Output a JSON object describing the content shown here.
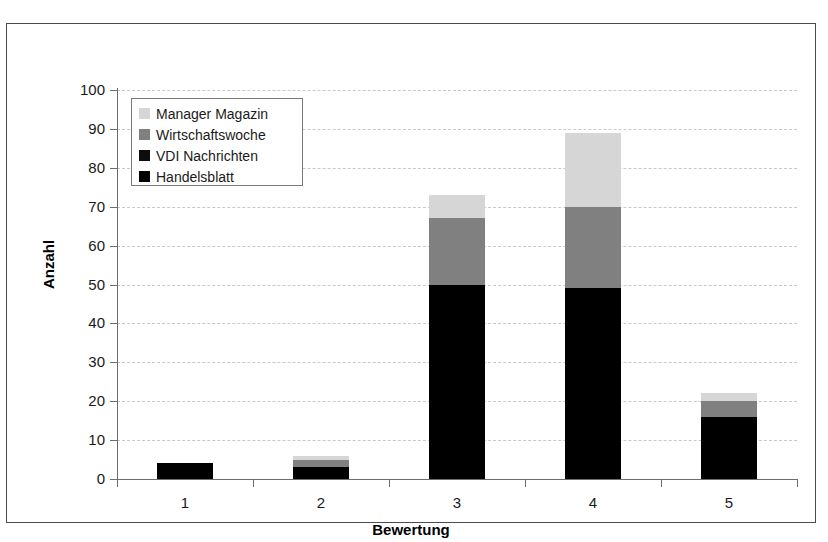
{
  "chart_data": {
    "type": "bar",
    "subtype": "stacked",
    "title": "",
    "xlabel": "Bewertung",
    "ylabel": "Anzahl",
    "categories": [
      "1",
      "2",
      "3",
      "4",
      "5"
    ],
    "ylim": [
      0,
      100
    ],
    "ytick_step": 10,
    "yticks": [
      "0",
      "10",
      "20",
      "30",
      "40",
      "50",
      "60",
      "70",
      "80",
      "90",
      "100"
    ],
    "grid": true,
    "grid_style": "dashed horizontal",
    "legend_position": "upper left inside plot",
    "series": [
      {
        "name": "Handelsblatt",
        "color": "#000000",
        "values": [
          4,
          3,
          50,
          49,
          16
        ]
      },
      {
        "name": "VDI Nachrichten",
        "color": "#0d0d0d",
        "values": [
          0,
          0,
          0,
          0,
          0
        ]
      },
      {
        "name": "Wirtschaftswoche",
        "color": "#808080",
        "values": [
          0,
          2,
          17,
          21,
          4
        ]
      },
      {
        "name": "Manager Magazin",
        "color": "#d6d6d6",
        "values": [
          0,
          1,
          6,
          19,
          2
        ]
      }
    ],
    "stack_order_bottom_to_top": [
      "Handelsblatt",
      "VDI Nachrichten",
      "Wirtschaftswoche",
      "Manager Magazin"
    ],
    "totals": [
      4,
      6,
      73,
      89,
      22
    ]
  },
  "legend": {
    "entries": [
      {
        "label": "Manager Magazin",
        "color": "#d6d6d6"
      },
      {
        "label": "Wirtschaftswoche",
        "color": "#808080"
      },
      {
        "label": "VDI Nachrichten",
        "color": "#0d0d0d"
      },
      {
        "label": "Handelsblatt",
        "color": "#000000"
      }
    ]
  },
  "axes": {
    "y_title": "Anzahl",
    "x_title": "Bewertung"
  }
}
